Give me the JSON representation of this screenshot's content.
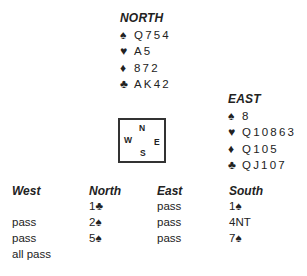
{
  "north": {
    "title": "NORTH",
    "spades": {
      "symbol": "♠",
      "cards": "Q754"
    },
    "hearts": {
      "symbol": "♥",
      "cards": "A5"
    },
    "diamonds": {
      "symbol": "♦",
      "cards": "872"
    },
    "clubs": {
      "symbol": "♣",
      "cards": "AK42"
    }
  },
  "east": {
    "title": "EAST",
    "spades": {
      "symbol": "♠",
      "cards": "8"
    },
    "hearts": {
      "symbol": "♥",
      "cards": "Q10863"
    },
    "diamonds": {
      "symbol": "♦",
      "cards": "Q105"
    },
    "clubs": {
      "symbol": "♣",
      "cards": "QJ107"
    }
  },
  "compass": {
    "n": "N",
    "w": "W",
    "e": "E",
    "s": "S"
  },
  "bidding": {
    "headers": [
      "West",
      "North",
      "East",
      "South"
    ],
    "rows": [
      [
        "",
        "1♣",
        "pass",
        "1♠"
      ],
      [
        "pass",
        "2♠",
        "pass",
        "4NT"
      ],
      [
        "pass",
        "5♠",
        "pass",
        "7♠"
      ],
      [
        "all pass",
        "",
        "",
        ""
      ]
    ]
  }
}
